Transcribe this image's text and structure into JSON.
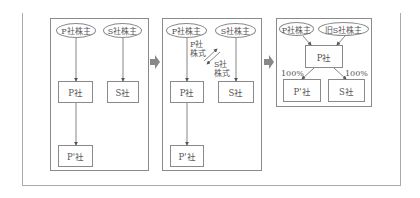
{
  "panels": {
    "before": {
      "shareholders": [
        "P社株主",
        "S社株主"
      ],
      "companies": [
        "P社",
        "S社",
        "P'社"
      ]
    },
    "exchange": {
      "shareholders": [
        "P社株主",
        "S社株主"
      ],
      "companies": [
        "P社",
        "S社",
        "P'社"
      ],
      "flow_labels": {
        "p_shares": "P社\n株式",
        "s_shares": "S社\n株式"
      },
      "p_shares_l1": "P社",
      "p_shares_l2": "株式",
      "s_shares_l1": "S社",
      "s_shares_l2": "株式"
    },
    "after": {
      "shareholders": [
        "P社株主",
        "旧S社株主"
      ],
      "companies": [
        "P社",
        "P'社",
        "S社"
      ],
      "ownership": [
        "100%",
        "100%"
      ]
    }
  },
  "colors": {
    "line": "#8a8a8a",
    "step_arrow": "#888888",
    "text": "#555555"
  }
}
